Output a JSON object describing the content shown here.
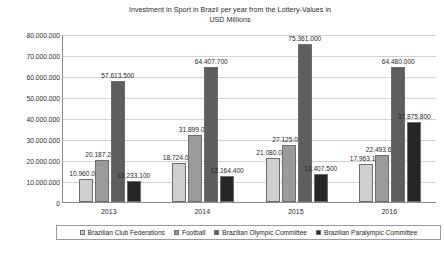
{
  "chart_data": {
    "type": "bar",
    "title": "Investment in Sport in Brazil per year from the Lottery-Values in USD Millions",
    "title_line1": "Investment in Sport in Brazil per year from the Lottery-Values in",
    "title_line2": "USD Millions",
    "xlabel": "",
    "ylabel": "",
    "ylim": [
      0,
      80000000
    ],
    "ytick_step": 10000000,
    "grid": true,
    "legend_position": "bottom",
    "categories": [
      "2013",
      "2014",
      "2015",
      "2016"
    ],
    "ytick_labels": [
      "80.000.000",
      "70.000.000",
      "60.000.000",
      "50.000.000",
      "40.000.000",
      "30.000.000",
      "20.000.000",
      "10.000.000",
      "0"
    ],
    "ytick_values": [
      80000000,
      70000000,
      60000000,
      50000000,
      40000000,
      30000000,
      20000000,
      10000000,
      0
    ],
    "series": [
      {
        "name": "Brazilian Club Federations",
        "color": "#cfcfcf",
        "values": [
          10960000,
          18724000,
          21080000,
          17963100
        ],
        "labels": [
          "10.960.000",
          "18.724.000",
          "21.080.000",
          "17.963.100"
        ]
      },
      {
        "name": "Football",
        "color": "#9a9a9a",
        "values": [
          20187200,
          31899000,
          27125000,
          22493600
        ],
        "labels": [
          "20.187.200",
          "31.899.000",
          "27.125.000",
          "22.493.600"
        ]
      },
      {
        "name": "Brazilian Olympic Committee",
        "color": "#5e5e5e",
        "values": [
          57613500,
          64407700,
          75361000,
          64480000
        ],
        "labels": [
          "57.613.500",
          "64.407.700",
          "75.361.000",
          "64.480.000"
        ]
      },
      {
        "name": "Brazilian Paralympic Committee",
        "color": "#262626",
        "values": [
          10233100,
          12164400,
          13407500,
          37875800
        ],
        "labels": [
          "10.233.100",
          "12.164.400",
          "13.407.500",
          "37.875.800"
        ]
      }
    ]
  },
  "caption": {
    "text": ""
  }
}
